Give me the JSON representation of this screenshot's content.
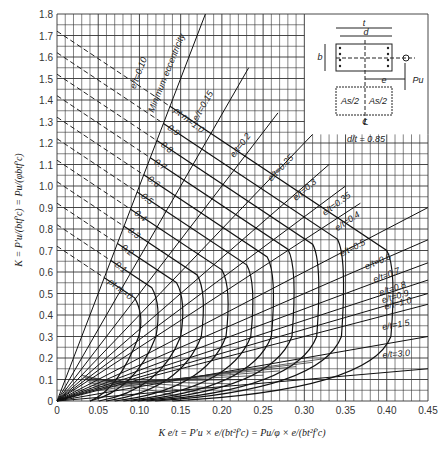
{
  "chart_data": {
    "type": "line",
    "xlabel": "K e/t = P'u × e/(b t² f'c) = (Pu/φ) × e/(b t² f'c)",
    "ylabel": "K = P'u/(b t f'c) = Pu/(φ b t f'c)",
    "xlim": [
      0,
      0.45
    ],
    "ylim": [
      0,
      1.8
    ],
    "x_ticks": [
      "0",
      "0.05",
      "0.10",
      "0.15",
      "0.20",
      "0.25",
      "0.30",
      "0.35",
      "0.40",
      "0.45"
    ],
    "y_ticks": [
      "0",
      "0.1",
      "0.2",
      "0.3",
      "0.4",
      "0.5",
      "0.6",
      "0.7",
      "0.8",
      "0.9",
      "1.0",
      "1.1",
      "1.2",
      "1.3",
      "1.4",
      "1.5",
      "1.6",
      "1.7",
      "1.8"
    ],
    "grid": true,
    "ptm_curves": {
      "label_prefix": "ρt m =",
      "values": [
        0,
        0.1,
        0.2,
        0.3,
        0.4,
        0.5,
        0.6,
        0.7,
        0.8,
        0.9,
        1.0
      ],
      "k_at_zero_moment": [
        0.72,
        0.82,
        0.92,
        1.02,
        1.12,
        1.22,
        1.32,
        1.42,
        1.52,
        1.62,
        1.72
      ],
      "balanced_x": [
        0.095,
        0.115,
        0.145,
        0.17,
        0.2,
        0.23,
        0.255,
        0.28,
        0.31,
        0.34,
        0.4
      ]
    },
    "eccentricity_lines": {
      "label_prefix": "e/t =",
      "values": [
        0.1,
        0.15,
        0.2,
        0.25,
        0.3,
        0.35,
        0.4,
        0.5,
        0.6,
        0.7,
        0.8,
        0.9,
        1.0,
        1.5,
        3.0
      ],
      "annotation_e_t_0_10": "Minimum eccentricity"
    },
    "inset": {
      "labels": [
        "t",
        "d",
        "b",
        "e",
        "Pu",
        "As/2",
        "As/2",
        "℄"
      ],
      "ratio_label": "d/t = 0.85"
    }
  },
  "labels": {
    "min_ecc": "Minimum eccentricity",
    "ratio": "d/t = 0.85",
    "x_caption": "K e/t = P′u × e/(bt²f′c) = Pu/φ × e/(bt²f′c)",
    "y_caption": "K = P′u/(btf′c) = Pu/(φbtf′c)"
  }
}
